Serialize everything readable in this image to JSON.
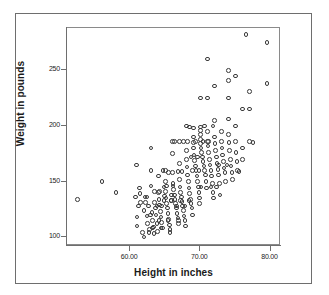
{
  "figure": {
    "background_color": "#ffffff",
    "frame_color": "#6e6e6e",
    "marker_color": "#3a3a3a"
  },
  "chart_data": {
    "type": "scatter",
    "title": "",
    "xlabel": "Height in inches",
    "ylabel": "Weight in pounds",
    "xlim": [
      51.0,
      81.5
    ],
    "ylim": [
      92.0,
      288.0
    ],
    "xticks": [
      "60.00",
      "70.00",
      "80.00"
    ],
    "xtick_values": [
      60,
      70,
      80
    ],
    "yticks": [
      "250",
      "200",
      "150",
      "100"
    ],
    "ytick_values": [
      250,
      200,
      150,
      100
    ],
    "grid": false,
    "legend": false,
    "marker": "open-circle",
    "n_points": 212,
    "series": [
      {
        "name": "Height vs Weight",
        "points": [
          [
            52.5,
            134
          ],
          [
            56.0,
            150
          ],
          [
            58.0,
            140
          ],
          [
            60.8,
            136
          ],
          [
            60.9,
            165
          ],
          [
            61.0,
            118
          ],
          [
            61.0,
            110
          ],
          [
            61.2,
            128
          ],
          [
            61.3,
            144
          ],
          [
            61.4,
            139
          ],
          [
            61.5,
            131
          ],
          [
            61.8,
            104
          ],
          [
            62.0,
            100
          ],
          [
            62.0,
            124
          ],
          [
            62.1,
            136
          ],
          [
            62.2,
            131
          ],
          [
            62.4,
            119
          ],
          [
            62.5,
            112
          ],
          [
            62.6,
            128
          ],
          [
            62.8,
            107
          ],
          [
            63.0,
            180
          ],
          [
            63.0,
            160
          ],
          [
            63.0,
            146
          ],
          [
            63.1,
            122
          ],
          [
            63.2,
            115
          ],
          [
            63.3,
            109
          ],
          [
            63.4,
            103
          ],
          [
            63.5,
            131
          ],
          [
            63.6,
            126
          ],
          [
            63.7,
            120
          ],
          [
            63.8,
            112
          ],
          [
            63.9,
            105
          ],
          [
            64.0,
            155
          ],
          [
            64.0,
            140
          ],
          [
            64.1,
            134
          ],
          [
            64.2,
            129
          ],
          [
            64.3,
            123
          ],
          [
            64.4,
            118
          ],
          [
            64.5,
            113
          ],
          [
            64.6,
            108
          ],
          [
            64.7,
            160
          ],
          [
            64.8,
            145
          ],
          [
            64.9,
            137
          ],
          [
            65.0,
            160
          ],
          [
            65.0,
            150
          ],
          [
            65.0,
            141
          ],
          [
            65.1,
            135
          ],
          [
            65.2,
            130
          ],
          [
            65.3,
            126
          ],
          [
            65.4,
            121
          ],
          [
            65.5,
            116
          ],
          [
            65.6,
            111
          ],
          [
            65.7,
            107
          ],
          [
            65.8,
            133
          ],
          [
            65.9,
            138
          ],
          [
            66.0,
            175
          ],
          [
            66.0,
            186
          ],
          [
            66.0,
            158
          ],
          [
            66.1,
            148
          ],
          [
            66.2,
            143
          ],
          [
            66.3,
            138
          ],
          [
            66.4,
            134
          ],
          [
            66.5,
            130
          ],
          [
            66.6,
            126
          ],
          [
            66.7,
            121
          ],
          [
            66.8,
            117
          ],
          [
            66.9,
            112
          ],
          [
            67.0,
            186
          ],
          [
            67.0,
            166
          ],
          [
            67.0,
            152
          ],
          [
            67.1,
            145
          ],
          [
            67.2,
            140
          ],
          [
            67.3,
            136
          ],
          [
            67.4,
            132
          ],
          [
            67.5,
            128
          ],
          [
            67.6,
            124
          ],
          [
            67.7,
            119
          ],
          [
            67.8,
            115
          ],
          [
            67.9,
            110
          ],
          [
            68.0,
            200
          ],
          [
            68.0,
            178
          ],
          [
            68.0,
            170
          ],
          [
            68.1,
            163
          ],
          [
            68.2,
            156
          ],
          [
            68.3,
            150
          ],
          [
            68.4,
            144
          ],
          [
            68.5,
            139
          ],
          [
            68.6,
            134
          ],
          [
            68.7,
            130
          ],
          [
            68.8,
            126
          ],
          [
            68.9,
            120
          ],
          [
            69.0,
            198
          ],
          [
            69.0,
            190
          ],
          [
            69.0,
            185
          ],
          [
            69.0,
            180
          ],
          [
            69.1,
            174
          ],
          [
            69.2,
            169
          ],
          [
            69.3,
            164
          ],
          [
            69.4,
            160
          ],
          [
            69.5,
            155
          ],
          [
            69.6,
            150
          ],
          [
            69.7,
            145
          ],
          [
            69.8,
            140
          ],
          [
            69.9,
            135
          ],
          [
            69.9,
            130
          ],
          [
            70.0,
            225
          ],
          [
            70.0,
            199
          ],
          [
            70.0,
            196
          ],
          [
            70.0,
            192
          ],
          [
            70.0,
            188
          ],
          [
            70.0,
            184
          ],
          [
            70.1,
            180
          ],
          [
            70.2,
            176
          ],
          [
            70.3,
            172
          ],
          [
            70.4,
            168
          ],
          [
            70.5,
            164
          ],
          [
            70.6,
            160
          ],
          [
            70.7,
            156
          ],
          [
            70.8,
            150
          ],
          [
            70.9,
            144
          ],
          [
            71.0,
            260
          ],
          [
            71.0,
            225
          ],
          [
            71.0,
            186
          ],
          [
            71.0,
            195
          ],
          [
            71.1,
            182
          ],
          [
            71.2,
            176
          ],
          [
            71.3,
            170
          ],
          [
            71.4,
            165
          ],
          [
            71.5,
            160
          ],
          [
            71.6,
            155
          ],
          [
            71.7,
            148
          ],
          [
            71.8,
            140
          ],
          [
            71.9,
            135
          ],
          [
            72.0,
            236
          ],
          [
            72.0,
            205
          ],
          [
            72.0,
            190
          ],
          [
            72.1,
            184
          ],
          [
            72.2,
            178
          ],
          [
            72.3,
            172
          ],
          [
            72.4,
            166
          ],
          [
            72.5,
            161
          ],
          [
            72.6,
            156
          ],
          [
            72.7,
            148
          ],
          [
            72.8,
            138
          ],
          [
            73.0,
            195
          ],
          [
            73.0,
            186
          ],
          [
            73.1,
            180
          ],
          [
            73.2,
            174
          ],
          [
            73.3,
            168
          ],
          [
            73.4,
            162
          ],
          [
            73.5,
            158
          ],
          [
            73.6,
            150
          ],
          [
            74.0,
            250
          ],
          [
            74.0,
            241
          ],
          [
            74.0,
            225
          ],
          [
            74.0,
            206
          ],
          [
            74.0,
            192
          ],
          [
            74.1,
            185
          ],
          [
            74.2,
            178
          ],
          [
            74.3,
            170
          ],
          [
            74.4,
            164
          ],
          [
            74.5,
            158
          ],
          [
            74.6,
            152
          ],
          [
            75.0,
            245
          ],
          [
            75.0,
            200
          ],
          [
            75.0,
            186
          ],
          [
            75.1,
            176
          ],
          [
            75.2,
            168
          ],
          [
            75.3,
            160
          ],
          [
            75.5,
            159
          ],
          [
            76.0,
            215
          ],
          [
            76.0,
            180
          ],
          [
            76.0,
            170
          ],
          [
            76.5,
            282
          ],
          [
            77.0,
            231
          ],
          [
            77.0,
            215
          ],
          [
            77.0,
            186
          ],
          [
            77.5,
            185
          ],
          [
            79.5,
            275
          ],
          [
            79.5,
            238
          ],
          [
            68.2,
            186
          ],
          [
            67.6,
            186
          ],
          [
            66.3,
            186
          ],
          [
            65.5,
            158
          ],
          [
            64.2,
            141
          ],
          [
            63.5,
            141
          ],
          [
            62.4,
            136
          ],
          [
            69.3,
            186
          ],
          [
            70.4,
            186
          ],
          [
            71.2,
            186
          ],
          [
            68.7,
            172
          ],
          [
            69.6,
            172
          ],
          [
            66.8,
            159
          ],
          [
            67.4,
            159
          ],
          [
            65.2,
            146
          ],
          [
            66.1,
            146
          ],
          [
            64.8,
            133
          ],
          [
            65.9,
            133
          ],
          [
            67.2,
            133
          ],
          [
            68.4,
            133
          ],
          [
            63.8,
            128
          ],
          [
            64.5,
            128
          ],
          [
            66.6,
            128
          ],
          [
            67.8,
            128
          ],
          [
            62.9,
            120
          ],
          [
            64.1,
            115
          ],
          [
            65.4,
            115
          ],
          [
            66.9,
            115
          ],
          [
            63.2,
            108
          ],
          [
            64.4,
            108
          ],
          [
            65.7,
            104
          ],
          [
            62.7,
            104
          ],
          [
            70.1,
            145
          ],
          [
            71.5,
            145
          ],
          [
            72.3,
            145
          ],
          [
            68.9,
            160
          ],
          [
            69.8,
            160
          ],
          [
            72.6,
            165
          ],
          [
            73.8,
            165
          ],
          [
            70.6,
            200
          ],
          [
            71.8,
            200
          ],
          [
            68.5,
            199
          ]
        ]
      }
    ]
  }
}
